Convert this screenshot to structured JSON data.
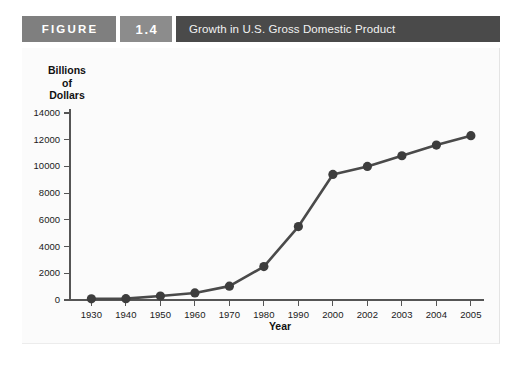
{
  "header": {
    "figure_label": "FIGURE",
    "figure_number": "1.4",
    "title": "Growth in U.S. Gross Domestic Product",
    "figure_box_color": "#7f7f7f",
    "number_box_color": "#8c8c8c",
    "title_box_color": "#4a4a4a"
  },
  "chart_data": {
    "type": "line",
    "title": "Growth in U.S. Gross Domestic Product",
    "xlabel": "Year",
    "ylabel": "Billions of Dollars",
    "ylabel_lines": [
      "Billions",
      "of",
      "Dollars"
    ],
    "categories": [
      "1930",
      "1940",
      "1950",
      "1960",
      "1970",
      "1980",
      "1990",
      "2000",
      "2002",
      "2003",
      "2004",
      "2005"
    ],
    "values": [
      91,
      100,
      294,
      526,
      1038,
      2500,
      5500,
      9400,
      10000,
      10800,
      11600,
      12300
    ],
    "ytick_labels": [
      "0",
      "2000",
      "4000",
      "6000",
      "8000",
      "10000",
      "12000",
      "14000"
    ],
    "ytick_values": [
      0,
      2000,
      4000,
      6000,
      8000,
      10000,
      12000,
      14000
    ],
    "ylim": [
      0,
      14000
    ],
    "grid": false,
    "legend": "none",
    "series_color": "#4a4a4a",
    "marker_color": "#3d3d3d",
    "marker": "circle",
    "plot_background": "#fbfbfb"
  }
}
